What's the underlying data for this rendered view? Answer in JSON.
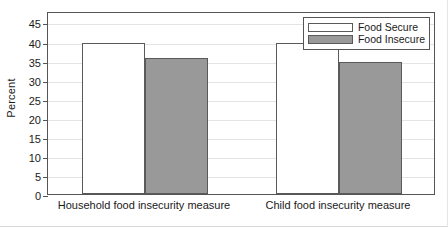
{
  "chart_data": {
    "type": "bar",
    "title": "",
    "xlabel": "",
    "ylabel": "Percent",
    "ylim": [
      0,
      48
    ],
    "ytick_values": [
      0,
      5,
      10,
      15,
      20,
      25,
      30,
      35,
      40,
      45
    ],
    "ytick_labels": [
      "0",
      "5",
      "10",
      "15",
      "20",
      "25",
      "30",
      "35",
      "40",
      "45"
    ],
    "grid": "horizontal",
    "legend_position": "top-right-inside",
    "categories": [
      "Household food insecurity measure",
      "Child food insecurity measure"
    ],
    "series": [
      {
        "name": "Food Secure",
        "color": "#ffffff",
        "edge_color": "#5a5a5a",
        "values": [
          39.5,
          39.5
        ]
      },
      {
        "name": "Food Insecure",
        "color": "#999999",
        "edge_color": "#5a5a5a",
        "values": [
          35.8,
          34.5
        ]
      }
    ]
  }
}
